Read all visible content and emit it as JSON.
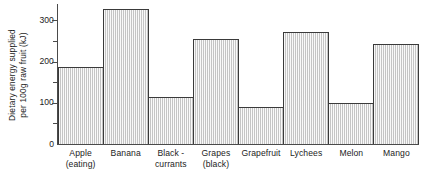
{
  "chart_data": {
    "type": "bar",
    "title": "",
    "xlabel": "",
    "ylabel_lines": [
      "Dietary energy supplied",
      "per 100g raw fruit (kJ)"
    ],
    "ylabel": "Dietary energy supplied per 100g raw fruit (kJ)",
    "categories": [
      "Apple (eating)",
      "Banana",
      "Black-currants",
      "Grapes (black)",
      "Grapefruit",
      "Lychees",
      "Melon",
      "Mango"
    ],
    "category_lines": [
      [
        "Apple",
        "(eating)"
      ],
      [
        "Banana",
        ""
      ],
      [
        "Black -",
        "currants"
      ],
      [
        "Grapes",
        "(black)"
      ],
      [
        "Grapefruit",
        ""
      ],
      [
        "Lychees",
        ""
      ],
      [
        "Melon",
        ""
      ],
      [
        "Mango",
        ""
      ]
    ],
    "values": [
      188,
      328,
      113,
      255,
      89,
      272,
      99,
      243
    ],
    "ylim": [
      0,
      340
    ],
    "ymajor_ticks": [
      0,
      100,
      200,
      300
    ],
    "ymajor_tick_labels": [
      "0",
      "100",
      "200",
      "300"
    ],
    "yminor_ticks": [
      50,
      150,
      250
    ],
    "grid": false,
    "legend": null,
    "bar_fill_color": "#d6d6d6",
    "bar_edge_color": "#3a3a3a",
    "axis_color": "#4a4a4a",
    "background_color": "#ffffff"
  }
}
